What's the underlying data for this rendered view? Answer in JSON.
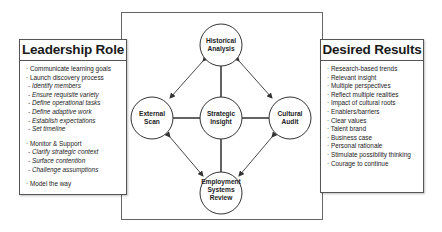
{
  "left_panel": {
    "title": "Leadership Role",
    "items": [
      {
        "text": "· Communicate learning goals",
        "type": "main"
      },
      {
        "text": "· Launch discovery process",
        "type": "main"
      },
      {
        "text": "- Identify members",
        "type": "sub"
      },
      {
        "text": "- Ensure requisite variety",
        "type": "sub"
      },
      {
        "text": "- Define operational tasks",
        "type": "sub"
      },
      {
        "text": "- Define adaptive work",
        "type": "sub"
      },
      {
        "text": "- Establish expectations",
        "type": "sub"
      },
      {
        "text": "- Set timeline",
        "type": "sub"
      },
      {
        "text": "· Monitor & Support",
        "type": "main"
      },
      {
        "text": "- Clarify strategic context",
        "type": "sub"
      },
      {
        "text": "- Surface contention",
        "type": "sub"
      },
      {
        "text": "- Challenge assumptions",
        "type": "sub"
      },
      {
        "text": "· Model the way",
        "type": "main"
      }
    ]
  },
  "right_panel": {
    "title": "Desired Results",
    "items": [
      "· Research-based trends",
      "· Relevant insight",
      "· Multiple perspectives",
      "· Reflect multiple realities",
      "· Impact of cultural roots",
      "· Enablers/barriers",
      "· Clear values",
      "· Talent brand",
      "· Business case",
      "· Personal rationale",
      "· Stimulate possibility thinking",
      "· Courage to continue"
    ]
  },
  "nodes": {
    "historical": {
      "line1": "Historical",
      "line2": "Analysis"
    },
    "external": {
      "line1": "External",
      "line2": "Scan"
    },
    "strategic": {
      "line1": "Strategic",
      "line2": "Insight"
    },
    "cultural": {
      "line1": "Cultural",
      "line2": "Audit"
    },
    "employment": {
      "line1": "Employment",
      "line2": "Systems",
      "line3": "Review"
    }
  },
  "colors": {
    "stroke": "#333333",
    "frame": "#666666",
    "background": "#ffffff"
  }
}
